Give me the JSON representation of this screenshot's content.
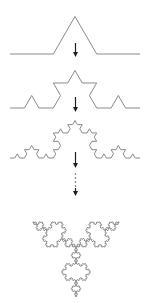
{
  "diagram": {
    "canvas": {
      "width": 154,
      "height": 303,
      "background": "#ffffff"
    },
    "colors": {
      "curve": "#8a8a8a",
      "arrow": "#1e1e1e",
      "dots": "#555555"
    },
    "curves": [
      {
        "name": "koch-curve-iteration-1",
        "iteration": 1,
        "start": [
          10,
          54
        ],
        "end": [
          140,
          54
        ]
      },
      {
        "name": "koch-curve-iteration-2",
        "iteration": 2,
        "start": [
          10,
          108
        ],
        "end": [
          140,
          108
        ]
      },
      {
        "name": "koch-curve-iteration-3",
        "iteration": 3,
        "start": [
          10,
          158
        ],
        "end": [
          140,
          158
        ]
      }
    ],
    "arrows": [
      {
        "name": "down-arrow-1",
        "x": 75.5,
        "y1": 43,
        "y2": 57
      },
      {
        "name": "down-arrow-2",
        "x": 75.5,
        "y1": 97,
        "y2": 112
      },
      {
        "name": "down-arrow-3",
        "x": 75.5,
        "y1": 152,
        "y2": 168
      },
      {
        "name": "down-arrow-4",
        "x": 75.5,
        "y1": 188,
        "y2": 196
      }
    ],
    "ellipsis_dots": {
      "name": "continuation-dots",
      "x": 75.5,
      "ys": [
        174,
        178,
        182,
        186
      ]
    },
    "snowflake": {
      "name": "koch-snowflake",
      "iteration": 4,
      "center": [
        76,
        247
      ],
      "radius": 50
    }
  }
}
